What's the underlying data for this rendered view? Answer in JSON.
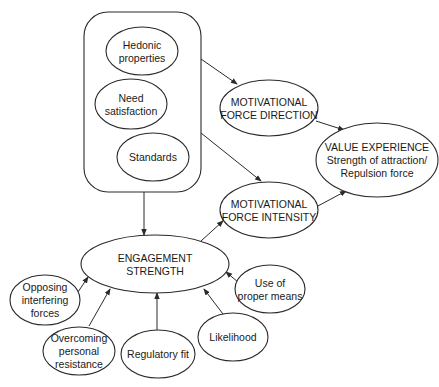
{
  "diagram": {
    "type": "concept-map",
    "colors": {
      "stroke": "#2a2a2a",
      "fill": "#ffffff",
      "text": "#1a1a1a"
    },
    "container": {
      "name": "value-sources-group",
      "x": 84,
      "y": 12,
      "width": 117,
      "height": 180,
      "radius": 24,
      "items": [
        {
          "id": "hedonic",
          "lines": [
            "Hedonic",
            "properties"
          ],
          "cx": 142,
          "cy": 51,
          "rx": 36,
          "ry": 24
        },
        {
          "id": "need",
          "lines": [
            "Need",
            "satisfaction"
          ],
          "cx": 131,
          "cy": 104,
          "rx": 36,
          "ry": 25
        },
        {
          "id": "standards",
          "lines": [
            "Standards"
          ],
          "cx": 153,
          "cy": 157,
          "rx": 36,
          "ry": 24
        }
      ]
    },
    "nodes": {
      "direction": {
        "lines": [
          "MOTIVATIONAL",
          "FORCE DIRECTION"
        ],
        "cx": 269,
        "cy": 108,
        "rx": 49,
        "ry": 28
      },
      "intensity": {
        "lines": [
          "MOTIVATIONAL",
          "FORCE INTENSITY"
        ],
        "cx": 269,
        "cy": 210,
        "rx": 49,
        "ry": 28
      },
      "value": {
        "lines": [
          "VALUE EXPERIENCE",
          "Strength of attraction/",
          "Repulsion force"
        ],
        "cx": 377,
        "cy": 160,
        "rx": 61,
        "ry": 37
      },
      "engagement": {
        "lines": [
          "ENGAGEMENT",
          "STRENGTH"
        ],
        "cx": 155,
        "cy": 264,
        "rx": 74,
        "ry": 29
      },
      "opposing": {
        "lines": [
          "Opposing",
          "interfering",
          "forces"
        ],
        "cx": 45,
        "cy": 300,
        "rx": 35,
        "ry": 25
      },
      "overcoming": {
        "lines": [
          "Overcoming",
          "personal",
          "resistance"
        ],
        "cx": 79,
        "cy": 351,
        "rx": 36,
        "ry": 24
      },
      "regulatory": {
        "lines": [
          "Regulatory fit"
        ],
        "cx": 158,
        "cy": 354,
        "rx": 37,
        "ry": 24
      },
      "likelihood": {
        "lines": [
          "Likelihood"
        ],
        "cx": 233,
        "cy": 337,
        "rx": 35,
        "ry": 24
      },
      "means": {
        "lines": [
          "Use of",
          "proper means"
        ],
        "cx": 270,
        "cy": 289,
        "rx": 35,
        "ry": 24
      }
    },
    "edges": [
      {
        "from": "container",
        "to": "direction",
        "x1": 201,
        "y1": 59,
        "x2": 237,
        "y2": 84
      },
      {
        "from": "container",
        "to": "intensity",
        "x1": 201,
        "y1": 133,
        "x2": 261,
        "y2": 181
      },
      {
        "from": "container",
        "to": "engagement",
        "x1": 144,
        "y1": 192,
        "x2": 144,
        "y2": 235
      },
      {
        "from": "engagement",
        "to": "intensity",
        "x1": 201,
        "y1": 241,
        "x2": 223,
        "y2": 221
      },
      {
        "from": "direction",
        "to": "value",
        "x1": 316,
        "y1": 121,
        "x2": 344,
        "y2": 130
      },
      {
        "from": "intensity",
        "to": "value",
        "x1": 316,
        "y1": 207,
        "x2": 346,
        "y2": 191
      },
      {
        "from": "opposing",
        "to": "engagement",
        "x1": 78,
        "y1": 292,
        "x2": 88,
        "y2": 277
      },
      {
        "from": "overcoming",
        "to": "engagement",
        "x1": 89,
        "y1": 326,
        "x2": 110,
        "y2": 289
      },
      {
        "from": "regulatory",
        "to": "engagement",
        "x1": 157,
        "y1": 330,
        "x2": 157,
        "y2": 293
      },
      {
        "from": "likelihood",
        "to": "engagement",
        "x1": 223,
        "y1": 314,
        "x2": 204,
        "y2": 289
      },
      {
        "from": "means",
        "to": "engagement",
        "x1": 238,
        "y1": 282,
        "x2": 226,
        "y2": 272
      }
    ]
  }
}
